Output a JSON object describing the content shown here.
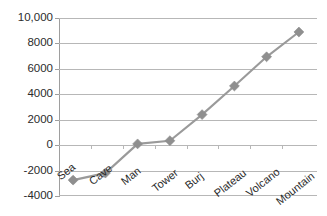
{
  "chart_data": {
    "type": "line",
    "title": "",
    "xlabel": "",
    "ylabel": "",
    "categories": [
      "Sea",
      "Cave",
      "Man",
      "Tower",
      "Burj",
      "Plateau",
      "Volcano",
      "Mountain"
    ],
    "values": [
      -2750,
      -2200,
      100,
      350,
      2400,
      4650,
      6950,
      8900
    ],
    "series": [
      {
        "name": "",
        "values": [
          -2750,
          -2200,
          100,
          350,
          2400,
          4650,
          6950,
          8900
        ]
      }
    ],
    "ylim": [
      -4000,
      10000
    ],
    "ytick_values": [
      10000,
      8000,
      6000,
      4000,
      2000,
      0,
      -2000,
      -4000
    ],
    "ytick_labels": [
      "10,000",
      "8000",
      "6000",
      "4000",
      "2000",
      "0",
      "-2000",
      "-4000"
    ],
    "grid": true,
    "legend": "none",
    "marker": "diamond",
    "colors": {
      "line": "#9a9a9a",
      "marker": "#8f8f8f",
      "gridline": "#b7b7b7",
      "axis": "#9e9e9e",
      "text": "#2b2b2b",
      "background": "#ffffff"
    }
  }
}
